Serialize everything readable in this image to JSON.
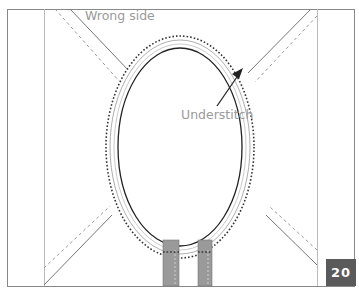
{
  "diagram": {
    "labels": {
      "wrong_side": "Wrong side",
      "understitch": "Understitch"
    },
    "step_number": "20",
    "colors": {
      "line": "#555555",
      "light_line": "#aaaaaa",
      "label_text": "#9a9a9a",
      "tab_fill": "#9a9a9a",
      "badge_bg": "#5a5a5a",
      "badge_text": "#ffffff"
    },
    "elements": [
      "garment panel outline",
      "armhole / neckline oval opening",
      "understitch dotted line",
      "seam allowance lines",
      "diagonal dashed seam lines",
      "two grey strap tabs at bottom",
      "arrow pointing to understitch"
    ]
  }
}
